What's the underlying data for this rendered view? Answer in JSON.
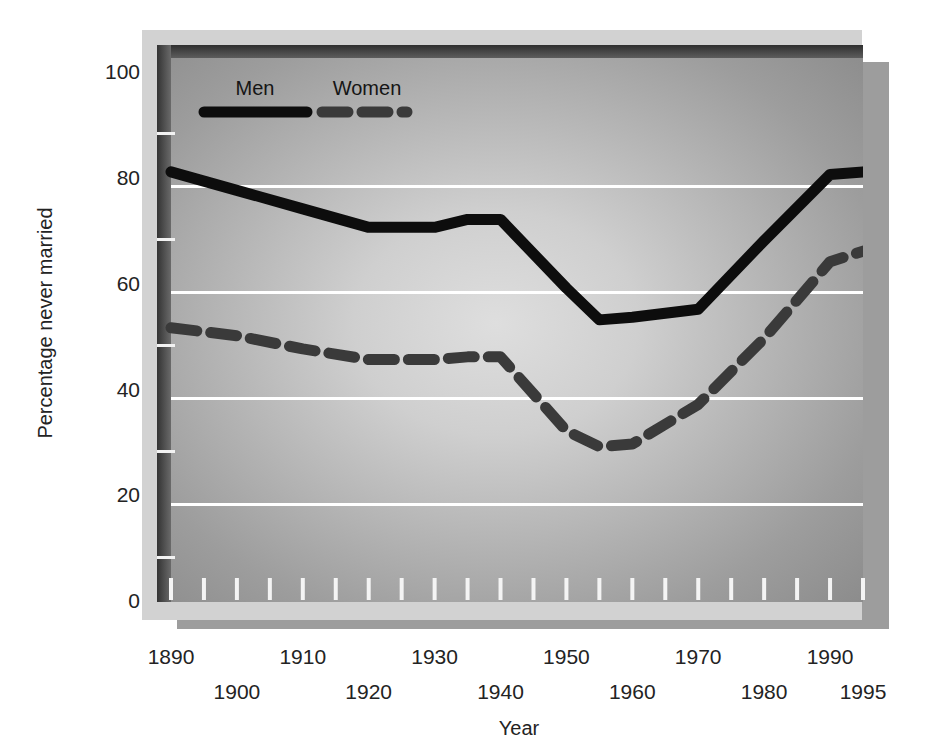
{
  "chart_data": {
    "type": "line",
    "title": "",
    "xlabel": "Year",
    "ylabel": "Percentage never married",
    "xlim": [
      1890,
      1995
    ],
    "ylim": [
      0,
      105
    ],
    "yticks": [
      0,
      20,
      40,
      60,
      80,
      100
    ],
    "ytick_labels": [
      "0",
      "20",
      "40",
      "60",
      "80",
      "100"
    ],
    "xticks": [
      1890,
      1900,
      1910,
      1920,
      1930,
      1940,
      1950,
      1960,
      1970,
      1980,
      1990,
      1995
    ],
    "xtick_labels": [
      "1890",
      "1900",
      "1910",
      "1920",
      "1930",
      "1940",
      "1950",
      "1960",
      "1970",
      "1980",
      "1990",
      "1995"
    ],
    "xtick_rows": [
      0,
      1,
      0,
      1,
      0,
      1,
      0,
      1,
      0,
      1,
      0,
      1
    ],
    "minor_xticks": [
      1890,
      1895,
      1900,
      1905,
      1910,
      1915,
      1920,
      1925,
      1930,
      1935,
      1940,
      1945,
      1950,
      1955,
      1960,
      1965,
      1970,
      1975,
      1980,
      1985,
      1990,
      1995
    ],
    "minor_yticks": [
      10,
      30,
      50,
      70,
      90
    ],
    "grid": "horizontal",
    "gridline_color": "#ffffff",
    "legend_position": "top-left-inside",
    "x": [
      1890,
      1900,
      1910,
      1920,
      1930,
      1935,
      1940,
      1950,
      1955,
      1960,
      1970,
      1980,
      1990,
      1995
    ],
    "series": [
      {
        "name": "Men",
        "style": "solid",
        "color": "#0d0d0d",
        "values": [
          81,
          77.5,
          74,
          70.5,
          70.5,
          72,
          72,
          59,
          53,
          53.5,
          55,
          68,
          80.5,
          81
        ]
      },
      {
        "name": "Women",
        "style": "dashed",
        "color": "#3a3a3a",
        "values": [
          51.5,
          50,
          47.5,
          45.5,
          45.5,
          46,
          46,
          32,
          29,
          29.5,
          37,
          49.5,
          64,
          66
        ]
      }
    ]
  },
  "legend": {
    "items": [
      {
        "label": "Men",
        "style": "solid"
      },
      {
        "label": "Women",
        "style": "dashed"
      }
    ]
  },
  "colors": {
    "page_background": "#ffffff",
    "outer_frame": "#d2d2d2",
    "plot_fill_center": "#d8d8d8",
    "plot_fill_edge": "#8e8e8e",
    "plot_border_dark": "#3c3c3c",
    "drop_shadow": "#9d9d9d",
    "gridline": "#ffffff",
    "men_line": "#0d0d0d",
    "women_line": "#3a3a3a",
    "text": "#232323"
  }
}
